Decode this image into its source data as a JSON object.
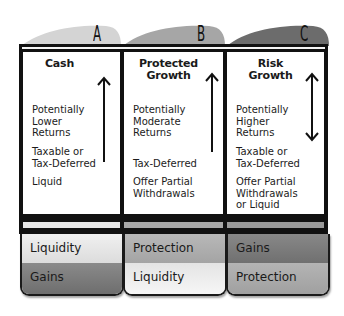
{
  "diagram": {
    "colors": {
      "tab_a": "#d6d6d6",
      "tab_b": "#a8a8a8",
      "tab_c": "#6e6e6e",
      "frame": "#111111",
      "light": "#e6e6e6",
      "medium": "#b0b0b0",
      "dark": "#7a7a7a"
    },
    "columns": [
      {
        "tab_letter": "A",
        "title_line1": "Cash",
        "title_line2": "",
        "arrow": "up",
        "return_text": [
          "Potentially",
          "Lower",
          "Returns"
        ],
        "tax_text": [
          "Taxable or",
          "Tax-Deferred"
        ],
        "access_text": [
          "Liquid"
        ],
        "boxes": [
          {
            "label": "Liquidity",
            "shade": "light"
          },
          {
            "label": "Gains",
            "shade": "dark"
          }
        ]
      },
      {
        "tab_letter": "B",
        "title_line1": "Protected",
        "title_line2": "Growth",
        "arrow": "up",
        "return_text": [
          "Potentially",
          "Moderate",
          "Returns"
        ],
        "tax_text": [
          "Tax-Deferred"
        ],
        "access_text": [
          "Offer Partial",
          "Withdrawals"
        ],
        "boxes": [
          {
            "label": "Protection",
            "shade": "medium"
          },
          {
            "label": "Liquidity",
            "shade": "light"
          }
        ]
      },
      {
        "tab_letter": "C",
        "title_line1": "Risk",
        "title_line2": "Growth",
        "arrow": "both",
        "return_text": [
          "Potentially",
          "Higher",
          "Returns"
        ],
        "tax_text": [
          "Taxable or",
          "Tax-Deferred"
        ],
        "access_text": [
          "Offer Partial",
          "Withdrawals",
          "or Liquid"
        ],
        "boxes": [
          {
            "label": "Gains",
            "shade": "dark"
          },
          {
            "label": "Protection",
            "shade": "medium"
          }
        ]
      }
    ]
  }
}
